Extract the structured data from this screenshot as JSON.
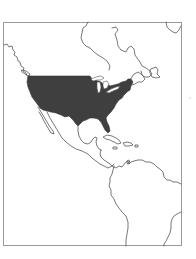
{
  "map": {
    "type": "outline-locator-map",
    "region": "Americas (North America, Central America, northern South America)",
    "highlighted_region": "Contiguous United States",
    "colors": {
      "background": "#ffffff",
      "highlight_fill": "#3f3f3f",
      "coastline_stroke": "#555555",
      "frame_stroke": "#9a9a9a"
    },
    "frame": {
      "x": 3,
      "y": 22,
      "width": 179,
      "height": 224
    },
    "labels": []
  }
}
